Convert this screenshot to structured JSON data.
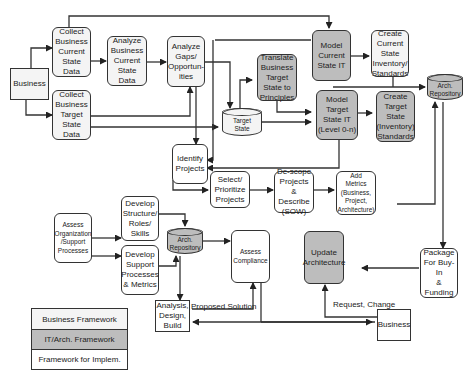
{
  "diagram": {
    "nodes": {
      "business_source": "Business",
      "collect_current": "Collect\nBusiness\nCurrent\nState\nData",
      "collect_target": "Collect\nBusiness\nTarget\nState\nData",
      "analyze_current": "Analyze\nBusiness\nCurrent\nState\nData",
      "analyze_gaps": "Analyze\nGaps/\nOpportun-\nities",
      "target_state": "Target\nState",
      "translate_target": "Translate\nBusiness\nTarget\nState to\nPrinciples",
      "model_current_it": "Model\nCurrent\nState IT",
      "model_target_it": "Model\nTarget\nState IT\n(Level 0-n)",
      "create_current_inventory": "Create\nCurrent\nState\nInventory/\nStandards",
      "create_target_inventory": "Create\nTarget\nState\n(Inventory)\nStandards",
      "arch_repository_top": "Arch.\nRepository",
      "identify_projects": "Identify\nProjects",
      "select_prioritize": "Select/\nPrioritize\nProjects",
      "descope_projects": "De-scope\nProjects\n&\nDescribe\n(SOW)",
      "add_metrics": "Add\nMetrics\n(Business,\nProject,\nArchitecture)",
      "assess_org": "Assess\nOrganization\n/Support\nProcesses",
      "develop_structure": "Develop\nStructure/\nRoles/\nSkills",
      "develop_support": "Develop\nSupport\nProcesses\n& Metrics",
      "arch_repository_bottom": "Arch.\nRepository",
      "assess_compliance": "Assess\nCompliance",
      "update_architecture": "Update\nArchitecture",
      "package_funding": "Package\nFor Buy-In\n& Funding",
      "analysis_design_build": "Analysis,\nDesign,\nBuild",
      "business_sink": "Business"
    },
    "edge_labels": {
      "proposed_solution": "Proposed Solution",
      "request_change": "Request, Change"
    }
  },
  "legend": {
    "items": [
      {
        "label": "Business Framework",
        "color": "#f4f4f4"
      },
      {
        "label": "IT/Arch. Framework",
        "color": "#bdbdbd"
      },
      {
        "label": "Framework for Implem.",
        "color": "#ffffff"
      }
    ]
  }
}
